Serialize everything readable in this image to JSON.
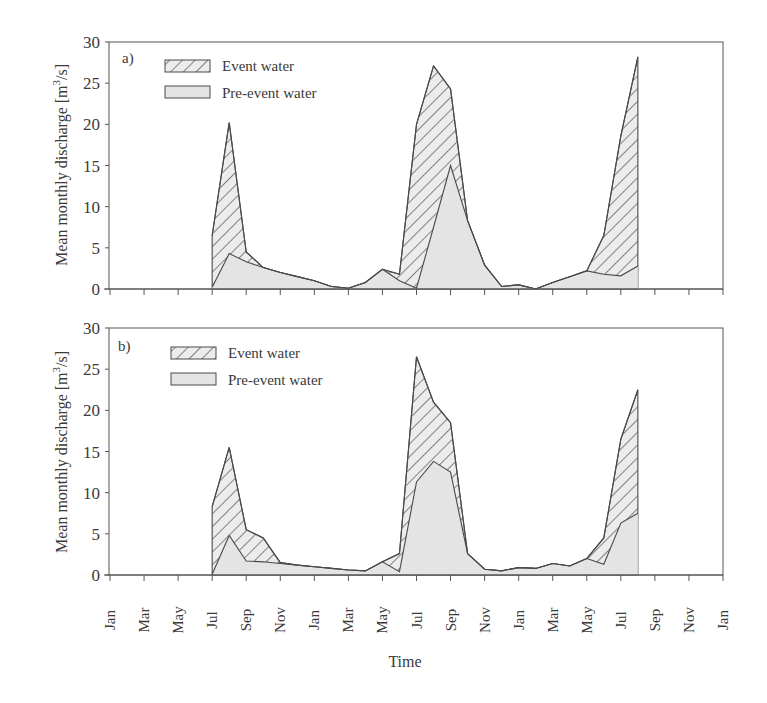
{
  "chart_data": [
    {
      "type": "area",
      "panel_label": "a)",
      "title": "",
      "xlabel": "",
      "ylabel": "Mean monthly discharge [m3/s]",
      "ylim": [
        0,
        30
      ],
      "yticks": [
        0,
        5,
        10,
        15,
        20,
        25,
        30
      ],
      "grid": false,
      "legend_position": "upper-left",
      "x": [
        "Jul",
        "Aug",
        "Sep",
        "Oct",
        "Nov",
        "Dec",
        "Jan",
        "Feb",
        "Mar",
        "Apr",
        "May",
        "Jun",
        "Jul",
        "Aug",
        "Sep",
        "Oct",
        "Nov",
        "Dec",
        "Jan",
        "Feb",
        "Mar",
        "Apr",
        "May",
        "Jun",
        "Jul",
        "Aug"
      ],
      "x_start_month_index": 6,
      "series": [
        {
          "name": "Event water",
          "role": "total",
          "values": [
            6.5,
            20.2,
            4.5,
            2.6,
            2.0,
            1.5,
            1.0,
            0.3,
            0.1,
            0.8,
            2.4,
            1.8,
            20.0,
            27.1,
            24.3,
            8.3,
            2.9,
            0.3,
            0.5,
            0.0,
            0.8,
            1.5,
            2.2,
            6.5,
            18.6,
            28.2
          ]
        },
        {
          "name": "Pre-event water",
          "role": "base",
          "values": [
            0.2,
            4.3,
            3.3,
            2.6,
            2.0,
            1.5,
            1.0,
            0.3,
            0.1,
            0.8,
            2.4,
            1.0,
            0.1,
            7.5,
            15.0,
            8.3,
            2.9,
            0.3,
            0.5,
            0.0,
            0.8,
            1.5,
            2.2,
            1.8,
            1.6,
            2.8
          ]
        }
      ]
    },
    {
      "type": "area",
      "panel_label": "b)",
      "title": "",
      "xlabel": "Time",
      "ylabel": "Mean monthly discharge [m3/s]",
      "ylim": [
        0,
        30
      ],
      "yticks": [
        0,
        5,
        10,
        15,
        20,
        25,
        30
      ],
      "grid": false,
      "legend_position": "upper-left",
      "x": [
        "Jul",
        "Aug",
        "Sep",
        "Oct",
        "Nov",
        "Dec",
        "Jan",
        "Feb",
        "Mar",
        "Apr",
        "May",
        "Jun",
        "Jul",
        "Aug",
        "Sep",
        "Oct",
        "Nov",
        "Dec",
        "Jan",
        "Feb",
        "Mar",
        "Apr",
        "May",
        "Jun",
        "Jul",
        "Aug"
      ],
      "x_start_month_index": 6,
      "series": [
        {
          "name": "Event water",
          "role": "total",
          "values": [
            8.3,
            15.5,
            5.5,
            4.5,
            1.5,
            1.2,
            1.0,
            0.8,
            0.6,
            0.5,
            1.6,
            2.6,
            26.5,
            21.0,
            18.5,
            2.6,
            0.7,
            0.5,
            0.9,
            0.8,
            1.4,
            1.1,
            2.0,
            4.5,
            16.5,
            22.5
          ]
        },
        {
          "name": "Pre-event water",
          "role": "base",
          "values": [
            0.1,
            4.8,
            1.7,
            1.6,
            1.4,
            1.2,
            1.0,
            0.8,
            0.6,
            0.5,
            1.6,
            0.4,
            11.3,
            13.8,
            12.5,
            2.6,
            0.7,
            0.5,
            0.9,
            0.8,
            1.4,
            1.1,
            2.0,
            1.3,
            6.3,
            7.5
          ]
        }
      ]
    }
  ],
  "xaxis": {
    "tick_labels": [
      "Jan",
      "Mar",
      "May",
      "Jul",
      "Sep",
      "Nov",
      "Jan",
      "Mar",
      "May",
      "Jul",
      "Sep",
      "Nov",
      "Jan",
      "Mar",
      "May",
      "Jul",
      "Sep",
      "Nov",
      "Jan"
    ],
    "label": "Time"
  },
  "yaxis": {
    "label_main": "Mean monthly discharge [m",
    "label_sup": "3",
    "label_end": "/s]"
  },
  "legend": {
    "event": "Event water",
    "pre_event": "Pre-event water"
  },
  "colors": {
    "pre_event_fill": "#e4e4e4",
    "event_fill": "#ececec",
    "hatch": "#4a4a4a",
    "line": "#4a4a4a",
    "axis": "#555555"
  }
}
